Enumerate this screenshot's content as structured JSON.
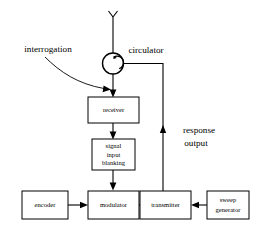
{
  "diagram": {
    "ink_color": "#000000",
    "background_color": "#ffffff",
    "blocks": [
      {
        "id": "receiver",
        "label": "receiver",
        "lines": [
          "receiver"
        ]
      },
      {
        "id": "signal-blanking",
        "label": "signal input blanking",
        "lines": [
          "signal",
          "input",
          "blanking"
        ]
      },
      {
        "id": "encoder",
        "label": "encoder",
        "lines": [
          "encoder"
        ]
      },
      {
        "id": "modulator",
        "label": "modulator",
        "lines": [
          "modulator"
        ]
      },
      {
        "id": "transmitter",
        "label": "transmitter",
        "lines": [
          "transmitter"
        ]
      },
      {
        "id": "sweep-generator",
        "label": "sweep generator",
        "lines": [
          "sweep",
          "generator"
        ]
      }
    ],
    "labels": {
      "interrogation": "interrogation",
      "circulator": "circulator",
      "response": "response",
      "output": "output"
    },
    "symbols": {
      "antenna": "antenna-symbol",
      "circulator": "circulator-symbol"
    }
  }
}
